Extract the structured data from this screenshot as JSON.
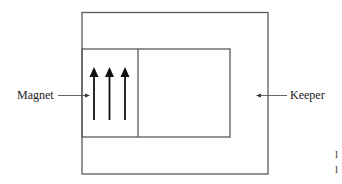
{
  "diagram": {
    "labels": {
      "magnet": "Magnet",
      "keeper": "Keeper"
    },
    "margin_marks": [
      "l",
      "l"
    ],
    "colors": {
      "line": "#5a5a5a",
      "arrow": "#111111",
      "text": "#1a1a1a",
      "background": "#ffffff"
    },
    "magnetization_arrows": 3,
    "arrow_direction": "up"
  }
}
